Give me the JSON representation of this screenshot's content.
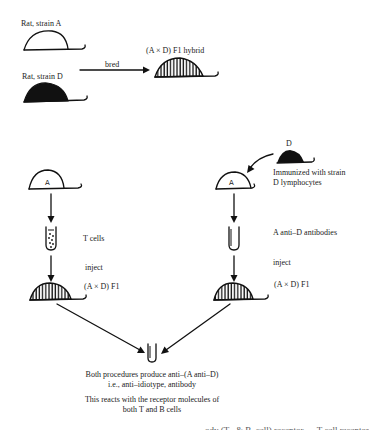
{
  "top": {
    "strain_a_label": "Rat, strain A",
    "strain_d_label": "Rat, strain D",
    "bred_label": "bred",
    "hybrid_label": "(A × D) F1 hybrid"
  },
  "left_path": {
    "rat_letter": "A",
    "cells_label": "T cells",
    "inject_label": "inject",
    "recipient_label": "(A × D) F1"
  },
  "right_path": {
    "donor_label": "D",
    "rat_letter": "A",
    "immunized_line1": "Immunized with strain",
    "immunized_line2": "D lymphocytes",
    "antibodies_label": "A anti–D antibodies",
    "inject_label": "inject",
    "recipient_label": "(A × D) F1"
  },
  "result": {
    "line1": "Both procedures produce anti–(A anti–D)",
    "line2": "i.e., anti–idiotype, antibody",
    "line3": "This reacts with the receptor molecules of",
    "line4": "both T and B cells"
  },
  "footer": {
    "cutoff_text": "ody (T– & B–cell) receptor — T cell receptor"
  },
  "icons": {
    "rat_white": "rat-strain-a-icon",
    "rat_black": "rat-strain-d-icon",
    "rat_hatched": "rat-hybrid-icon",
    "test_tube_cells": "test-tube-cells-icon",
    "test_tube_empty": "test-tube-icon"
  },
  "colors": {
    "ink": "#111111",
    "background": "#ffffff"
  }
}
